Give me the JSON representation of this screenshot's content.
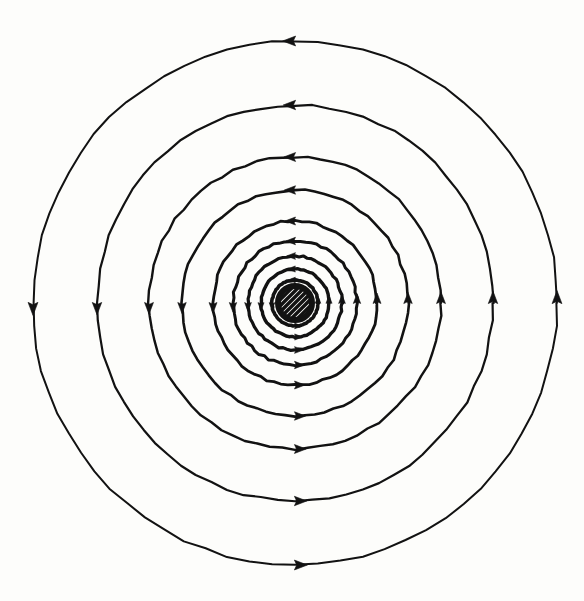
{
  "figure": {
    "kind": "physics-line-diagram",
    "background_color": "#fdfdfb",
    "ink_color": "#121212",
    "canvas": {
      "width": 584,
      "height": 601
    }
  },
  "chart_data": {
    "type": "line",
    "subtitle": "",
    "xlabel": "",
    "ylabel": "",
    "grid": false,
    "legend_position": "none",
    "axis_visible": false,
    "tick_labels": [],
    "annotations": [],
    "center": {
      "x": 295,
      "y": 303
    },
    "circulation_direction": "counterclockwise",
    "arrow_directions": {
      "top": "left",
      "right": "up",
      "bottom": "right",
      "left": "down"
    },
    "source_element": {
      "name": "wire-cross-section",
      "shape": "circle",
      "radius": 17,
      "ring_stroke_width": 6,
      "hatch_angle_deg": 45,
      "hatch_count": 7,
      "hatch_stroke_width": 3.4
    },
    "series": [
      {
        "name": "field-line-1",
        "radius": 23,
        "stroke_width": 3.6,
        "arrow_size": 7.0,
        "arrow_angles_deg": [
          90,
          0,
          270,
          180
        ]
      },
      {
        "name": "field-line-2",
        "radius": 34,
        "stroke_width": 3.4,
        "arrow_size": 7.6,
        "arrow_angles_deg": [
          90,
          0,
          270,
          180
        ]
      },
      {
        "name": "field-line-3",
        "radius": 47,
        "stroke_width": 3.2,
        "arrow_size": 8.4,
        "arrow_angles_deg": [
          90,
          0,
          270,
          180
        ]
      },
      {
        "name": "field-line-4",
        "radius": 62,
        "stroke_width": 3.0,
        "arrow_size": 9.2,
        "arrow_angles_deg": [
          90,
          0,
          270,
          180
        ]
      },
      {
        "name": "field-line-5",
        "radius": 82,
        "stroke_width": 2.8,
        "arrow_size": 10.0,
        "arrow_angles_deg": [
          90,
          0,
          270,
          180
        ]
      },
      {
        "name": "field-line-6",
        "radius": 113,
        "stroke_width": 2.6,
        "arrow_size": 10.6,
        "arrow_angles_deg": [
          90,
          0,
          270,
          180
        ]
      },
      {
        "name": "field-line-7",
        "radius": 146,
        "stroke_width": 2.4,
        "arrow_size": 11.2,
        "arrow_angles_deg": [
          90,
          0,
          270,
          180
        ]
      },
      {
        "name": "field-line-8",
        "radius": 198,
        "stroke_width": 2.2,
        "arrow_size": 11.8,
        "arrow_angles_deg": [
          90,
          0,
          270,
          180
        ]
      },
      {
        "name": "field-line-9",
        "radius": 262,
        "stroke_width": 2.0,
        "arrow_size": 12.4,
        "arrow_angles_deg": [
          90,
          0,
          270,
          180
        ]
      }
    ]
  }
}
